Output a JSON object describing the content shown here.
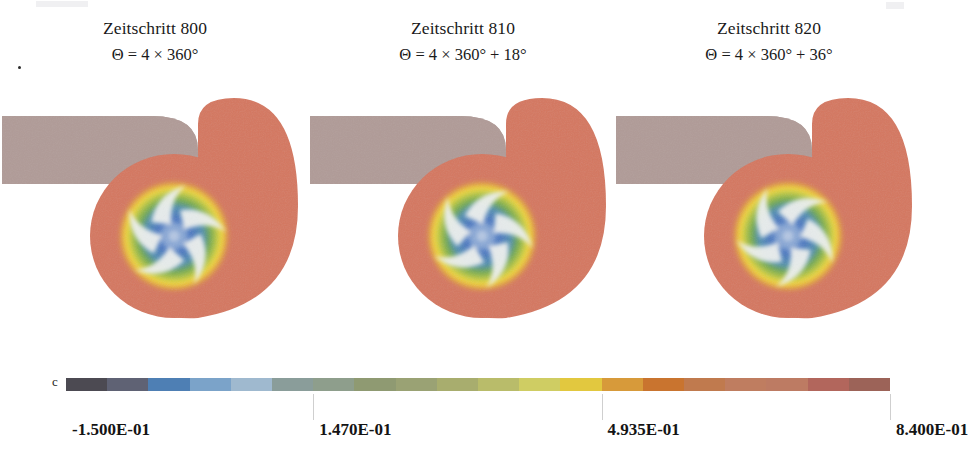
{
  "figure": {
    "kind": "cfd-centrifugal-pump-timestep-series",
    "panels": [
      {
        "id": "p0",
        "title": "Zeitschritt 800",
        "formula": "Θ = 4 × 360°",
        "has_leading_dot": true,
        "impeller_rotation_deg": 0
      },
      {
        "id": "p1",
        "title": "Zeitschritt 810",
        "formula": "Θ = 4 × 360° + 18°",
        "has_leading_dot": false,
        "impeller_rotation_deg": 18
      },
      {
        "id": "p2",
        "title": "Zeitschritt 820",
        "formula": "Θ = 4 × 360° + 36°",
        "has_leading_dot": false,
        "impeller_rotation_deg": 36
      }
    ]
  },
  "colorbar": {
    "letter": "c",
    "labels": [
      "-1.500E-01",
      "1.470E-01",
      "4.935E-01",
      "8.400E-01"
    ],
    "label_values": [
      -0.15,
      0.147,
      0.4935,
      0.84
    ],
    "range": [
      -0.15,
      0.84
    ],
    "colors": [
      "#4c4a52",
      "#5f6274",
      "#4e7fb4",
      "#7ba3c9",
      "#9fb9cf",
      "#8a9d9a",
      "#8e9e8c",
      "#8f9a72",
      "#9aa274",
      "#a8ad6e",
      "#b9bc6a",
      "#cfcd63",
      "#e2c83f",
      "#d79a3a",
      "#c9742f",
      "#c07a4e",
      "#bf7d60",
      "#bd7b63",
      "#b2665c",
      "#9c6358"
    ]
  },
  "geometry": {
    "volute_color": "#d4775f",
    "duct_color": "#b09b97",
    "blade_color": "#eef0ee",
    "hub_color": "#7fa0cf",
    "field_blue": "#4a77c0",
    "field_green": "#6fa84f",
    "field_yellow": "#f2d93a",
    "field_orange": "#d9813f"
  }
}
